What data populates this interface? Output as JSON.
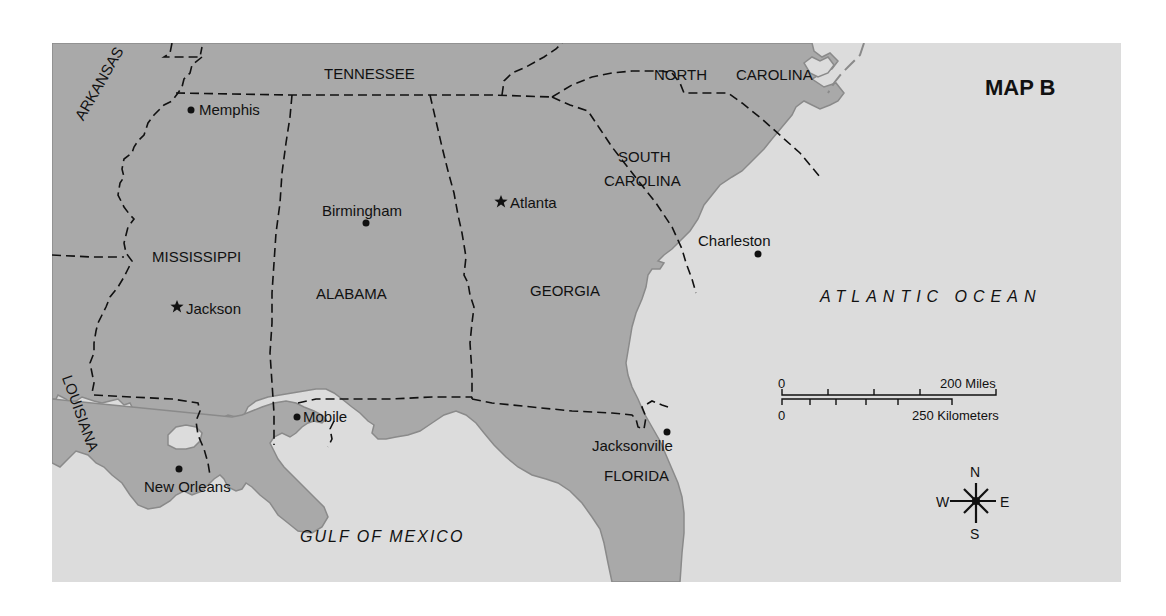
{
  "map": {
    "title": "MAP B",
    "colors": {
      "land": "#a9a9a9",
      "water": "#dcdcdc",
      "border": "#111111",
      "coast": "#8a8a8a"
    },
    "states": {
      "tennessee": "TENNESSEE",
      "north_carolina_1": "NORTH",
      "north_carolina_2": "CAROLINA",
      "south_carolina_1": "SOUTH",
      "south_carolina_2": "CAROLINA",
      "arkansas": "ARKANSAS",
      "mississippi": "MISSISSIPPI",
      "alabama": "ALABAMA",
      "georgia": "GEORGIA",
      "louisiana": "LOUISIANA",
      "florida": "FLORIDA"
    },
    "cities": [
      {
        "name": "Memphis",
        "marker": "dot"
      },
      {
        "name": "Birmingham",
        "marker": "dot"
      },
      {
        "name": "Atlanta",
        "marker": "star"
      },
      {
        "name": "Jackson",
        "marker": "star"
      },
      {
        "name": "Charleston",
        "marker": "dot"
      },
      {
        "name": "Mobile",
        "marker": "dot"
      },
      {
        "name": "New Orleans",
        "marker": "dot"
      },
      {
        "name": "Jacksonville",
        "marker": "dot"
      }
    ],
    "water_bodies": {
      "atlantic": "ATLANTIC OCEAN",
      "gulf": "GULF OF MEXICO"
    },
    "scale_bar": {
      "miles_zero": "0",
      "miles_max": "200 Miles",
      "km_zero": "0",
      "km_max": "250 Kilometers"
    },
    "compass": {
      "n": "N",
      "s": "S",
      "e": "E",
      "w": "W"
    }
  }
}
